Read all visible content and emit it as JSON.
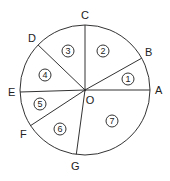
{
  "diagram": {
    "center": {
      "label": "O",
      "x": 85,
      "y": 90,
      "label_x": 90,
      "label_y": 104
    },
    "radius": 65,
    "points": [
      {
        "label": "A",
        "x": 150,
        "y": 90,
        "label_x": 155,
        "label_y": 94
      },
      {
        "label": "B",
        "x": 142,
        "y": 58,
        "label_x": 145,
        "label_y": 56
      },
      {
        "label": "C",
        "x": 85,
        "y": 25,
        "label_x": 81,
        "label_y": 19
      },
      {
        "label": "D",
        "x": 37,
        "y": 44,
        "label_x": 28,
        "label_y": 42
      },
      {
        "label": "E",
        "x": 20,
        "y": 92,
        "label_x": 8,
        "label_y": 96
      },
      {
        "label": "F",
        "x": 30,
        "y": 126,
        "label_x": 20,
        "label_y": 138
      },
      {
        "label": "G",
        "x": 76,
        "y": 157,
        "label_x": 71,
        "label_y": 170
      }
    ],
    "regions": [
      {
        "label": "1",
        "x": 128,
        "y": 79
      },
      {
        "label": "2",
        "x": 103,
        "y": 51
      },
      {
        "label": "3",
        "x": 68,
        "y": 51
      },
      {
        "label": "4",
        "x": 45,
        "y": 75
      },
      {
        "label": "5",
        "x": 40,
        "y": 104
      },
      {
        "label": "6",
        "x": 60,
        "y": 129
      },
      {
        "label": "7",
        "x": 112,
        "y": 121
      }
    ]
  }
}
